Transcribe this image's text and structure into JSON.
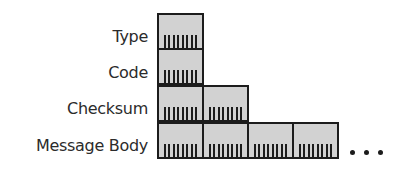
{
  "diagram": {
    "title": "",
    "fields": [
      {
        "label": "Type",
        "bytes": 1
      },
      {
        "label": "Code",
        "bytes": 1
      },
      {
        "label": "Checksum",
        "bytes": 2
      },
      {
        "label": "Message Body",
        "bytes": 4,
        "continues": true
      }
    ],
    "bits_per_byte": 8,
    "continuation_marker": "...",
    "colors": {
      "byte_fill": "#d2d2d2",
      "border": "#1c1c1c",
      "label_text": "#2b2b2b"
    }
  }
}
